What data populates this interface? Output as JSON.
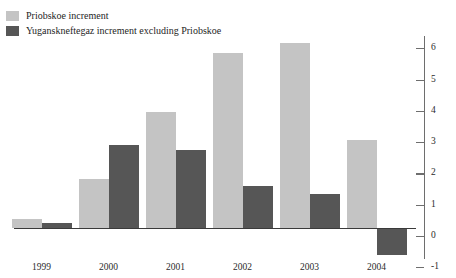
{
  "legend": {
    "position": "top-left",
    "items": [
      {
        "label": "Priobskoe increment",
        "color": "#c4c4c4",
        "swatch_name": "legend-swatch-priobskoe"
      },
      {
        "label": "Yuganskneftegaz increment excluding Priobskoe",
        "color": "#565656",
        "swatch_name": "legend-swatch-yuganskneftegaz"
      }
    ]
  },
  "axes": {
    "y_ticks": [
      "6",
      "5",
      "4",
      "3",
      "2",
      "1",
      "0",
      "-1"
    ],
    "x_ticks": [
      "1999",
      "2000",
      "2001",
      "2002",
      "2003",
      "2004"
    ]
  },
  "chart_data": {
    "type": "bar",
    "title": "",
    "subtitle": "",
    "xlabel": "",
    "ylabel": "",
    "categories": [
      "1999",
      "2000",
      "2001",
      "2002",
      "2003",
      "2004"
    ],
    "series": [
      {
        "name": "Priobskoe increment",
        "color": "#c4c4c4",
        "values": [
          0.3,
          1.55,
          3.7,
          5.6,
          5.9,
          2.8
        ]
      },
      {
        "name": "Yuganskneftegaz increment excluding Priobskoe",
        "color": "#565656",
        "values": [
          0.15,
          2.65,
          2.5,
          1.35,
          1.1,
          -0.85
        ]
      }
    ],
    "ylim": [
      -1,
      6
    ],
    "ytick_step": 1,
    "grid": false,
    "legend_position": "top-left",
    "zero_line": true
  }
}
